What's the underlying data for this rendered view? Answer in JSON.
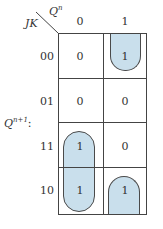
{
  "kmap": {
    "row_var": "JK",
    "col_var": "Q",
    "col_var_sup": "n",
    "output_label": "Q",
    "output_sup": "n+1",
    "output_suffix": ":",
    "col_headers": [
      "0",
      "1"
    ],
    "row_headers": [
      "00",
      "01",
      "11",
      "10"
    ],
    "cells": [
      [
        "0",
        "1"
      ],
      [
        "0",
        "0"
      ],
      [
        "1",
        "0"
      ],
      [
        "1",
        "1"
      ]
    ],
    "loop_color": "#c9dfec",
    "groups": [
      {
        "name": "group-Qn1-JK00",
        "cells": [
          [
            0,
            1
          ]
        ],
        "note": "wraps top edge"
      },
      {
        "name": "group-J1-Qn0",
        "cells": [
          [
            2,
            0
          ],
          [
            3,
            0
          ]
        ]
      },
      {
        "name": "group-Qn1-JK10",
        "cells": [
          [
            3,
            1
          ]
        ],
        "note": "wraps bottom edge"
      }
    ]
  }
}
